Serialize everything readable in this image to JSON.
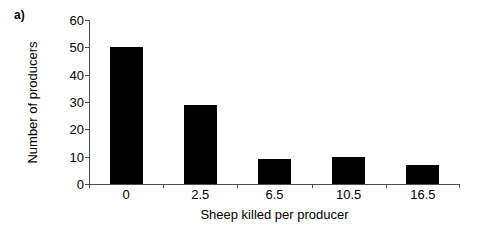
{
  "figure": {
    "panel_label": "a)",
    "background_color": "#ffffff",
    "axis_color": "#4d4d4d",
    "bar_color": "#000000"
  },
  "chart_data": {
    "type": "bar",
    "title": "",
    "categories": [
      "0",
      "2.5",
      "6.5",
      "10.5",
      "16.5"
    ],
    "values": [
      50,
      29,
      9,
      10,
      7
    ],
    "xlabel": "Sheep killed per producer",
    "ylabel": "Number of producers",
    "ylim": [
      0,
      60
    ],
    "yticks": [
      0,
      10,
      20,
      30,
      40,
      50,
      60
    ],
    "ytick_labels": [
      "0",
      "10",
      "20",
      "30",
      "40",
      "50",
      "60"
    ],
    "grid": false,
    "legend": false,
    "series_name": "Number of producers"
  }
}
